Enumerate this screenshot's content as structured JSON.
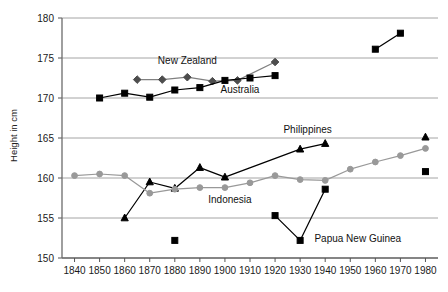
{
  "chart_data": {
    "type": "line",
    "title": "",
    "xlabel": "",
    "ylabel": "Height in cm",
    "xlim": [
      1835,
      1985
    ],
    "ylim": [
      150,
      180
    ],
    "yticks": [
      150,
      155,
      160,
      165,
      170,
      175,
      180
    ],
    "xticks": [
      1840,
      1850,
      1860,
      1870,
      1880,
      1890,
      1900,
      1910,
      1920,
      1930,
      1940,
      1950,
      1960,
      1970,
      1980
    ],
    "grid": "horizontal",
    "legend": "inline-annotations",
    "series": [
      {
        "name": "New Zealand",
        "marker": "diamond",
        "color": "#4d4d4d",
        "line_color": "#808080",
        "points": [
          {
            "x": 1865,
            "y": 172.3
          },
          {
            "x": 1875,
            "y": 172.3
          },
          {
            "x": 1885,
            "y": 172.6
          },
          {
            "x": 1895,
            "y": 172.1
          },
          {
            "x": 1905,
            "y": 172.2
          },
          {
            "x": 1920,
            "y": 174.5
          }
        ]
      },
      {
        "name": "Australia",
        "marker": "square",
        "color": "#000000",
        "line_color": "#000000",
        "points": [
          {
            "x": 1850,
            "y": 170.0
          },
          {
            "x": 1860,
            "y": 170.6
          },
          {
            "x": 1870,
            "y": 170.1
          },
          {
            "x": 1880,
            "y": 171.0
          },
          {
            "x": 1890,
            "y": 171.3
          },
          {
            "x": 1900,
            "y": 172.2
          },
          {
            "x": 1910,
            "y": 172.5
          },
          {
            "x": 1920,
            "y": 172.8
          }
        ]
      },
      {
        "name": "New Zealand late",
        "marker": "square",
        "color": "#000000",
        "line_color": "#000000",
        "points": [
          {
            "x": 1960,
            "y": 176.1
          },
          {
            "x": 1970,
            "y": 178.1
          }
        ]
      },
      {
        "name": "Philippines",
        "marker": "triangle",
        "color": "#000000",
        "line_color": "#000000",
        "points": [
          {
            "x": 1860,
            "y": 155.0
          },
          {
            "x": 1870,
            "y": 159.5
          },
          {
            "x": 1880,
            "y": 158.7
          },
          {
            "x": 1890,
            "y": 161.3
          },
          {
            "x": 1900,
            "y": 160.1
          },
          {
            "x": 1930,
            "y": 163.6
          },
          {
            "x": 1940,
            "y": 164.3
          }
        ]
      },
      {
        "name": "Philippines 1980",
        "marker": "triangle",
        "color": "#000000",
        "line_color": "#000000",
        "points": [
          {
            "x": 1980,
            "y": 165.1
          }
        ]
      },
      {
        "name": "Indonesia",
        "marker": "circle",
        "color": "#999999",
        "line_color": "#999999",
        "points": [
          {
            "x": 1840,
            "y": 160.3
          },
          {
            "x": 1850,
            "y": 160.5
          },
          {
            "x": 1860,
            "y": 160.3
          },
          {
            "x": 1870,
            "y": 158.1
          },
          {
            "x": 1880,
            "y": 158.6
          },
          {
            "x": 1890,
            "y": 158.8
          },
          {
            "x": 1900,
            "y": 158.8
          },
          {
            "x": 1910,
            "y": 159.4
          },
          {
            "x": 1920,
            "y": 160.3
          },
          {
            "x": 1930,
            "y": 159.8
          },
          {
            "x": 1940,
            "y": 159.7
          },
          {
            "x": 1950,
            "y": 161.1
          },
          {
            "x": 1960,
            "y": 162.0
          },
          {
            "x": 1970,
            "y": 162.8
          },
          {
            "x": 1980,
            "y": 163.7
          }
        ]
      },
      {
        "name": "Papua New Guinea",
        "marker": "square",
        "color": "#000000",
        "line_color": "#000000",
        "points": [
          {
            "x": 1920,
            "y": 155.3
          },
          {
            "x": 1930,
            "y": 152.2
          },
          {
            "x": 1940,
            "y": 158.6
          }
        ]
      },
      {
        "name": "Papua New Guinea early",
        "marker": "square",
        "color": "#000000",
        "line_color": "#000000",
        "points": [
          {
            "x": 1880,
            "y": 152.2
          }
        ]
      },
      {
        "name": "Papua New Guinea 1980",
        "marker": "square",
        "color": "#000000",
        "line_color": "#000000",
        "points": [
          {
            "x": 1980,
            "y": 160.8
          }
        ]
      }
    ],
    "annotations": [
      {
        "text": "New Zealand",
        "x": 1885,
        "y": 174.2,
        "anchor": "middle"
      },
      {
        "text": "Australia",
        "x": 1906,
        "y": 170.6,
        "anchor": "middle"
      },
      {
        "text": "Philippines",
        "x": 1933,
        "y": 165.6,
        "anchor": "middle"
      },
      {
        "text": "Indonesia",
        "x": 1902,
        "y": 156.9,
        "anchor": "middle"
      },
      {
        "text": "Papua New Guinea",
        "x": 1953,
        "y": 152.0,
        "anchor": "middle"
      }
    ]
  }
}
